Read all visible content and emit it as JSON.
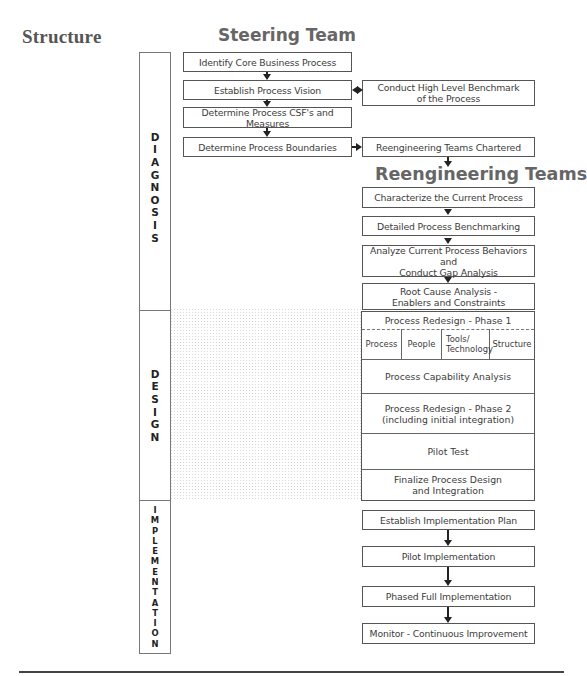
{
  "section_title": "Structure",
  "steering": {
    "title": "Steering Team",
    "boxes": [
      "Identify Core Business Process",
      "Establish Process Vision",
      "Determine Process CSF's and Measures",
      "Determine Process Boundaries"
    ]
  },
  "side_boxes": {
    "benchmark": [
      "Conduct High Level Benchmark",
      "of the Process"
    ],
    "chartered": "Reengineering Teams Chartered"
  },
  "reengineering": {
    "title": "Reengineering  Teams",
    "diagnosis_boxes": [
      [
        "Characterize the Current Process"
      ],
      [
        "Detailed Process Benchmarking"
      ],
      [
        "Analyze Current Process Behaviors and",
        "Conduct Gap Analysis"
      ],
      [
        "Root Cause Analysis -",
        "Enablers and Constraints"
      ]
    ],
    "design": {
      "phase1_title": "Process Redesign - Phase 1",
      "phase1_cells": [
        "Process",
        "People",
        "Tools/ Technology",
        "Structure"
      ],
      "rows": [
        [
          "Process Capability Analysis"
        ],
        [
          "Process Redesign - Phase 2",
          "(including initial integration)"
        ],
        [
          "Pilot Test"
        ],
        [
          "Finalize Process Design",
          "and Integration"
        ]
      ]
    },
    "implementation_boxes": [
      "Establish Implementation Plan",
      "Pilot Implementation",
      "Phased Full Implementation",
      "Monitor - Continuous Improvement"
    ]
  },
  "phases": [
    {
      "name": "DIAGNOSIS",
      "letters": [
        "D",
        "I",
        "A",
        "G",
        "N",
        "O",
        "S",
        "I",
        "S"
      ]
    },
    {
      "name": "DESIGN",
      "letters": [
        "D",
        "E",
        "S",
        "I",
        "G",
        "N"
      ]
    },
    {
      "name": "IMPLEMENTATION",
      "letters": [
        "I",
        "M",
        "P",
        "L",
        "E",
        "M",
        "E",
        "N",
        "T",
        "A",
        "T",
        "I",
        "O",
        "N"
      ]
    }
  ],
  "colors": {
    "title_gray": "#666666",
    "box_border": "#555555",
    "arrow": "#222222",
    "dot_pattern": "#d8d8d8"
  }
}
